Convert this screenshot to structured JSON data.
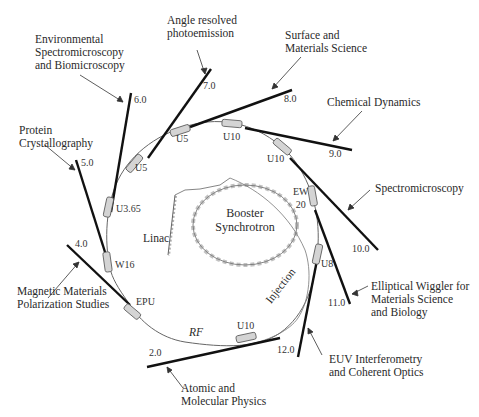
{
  "diagram": {
    "center": {
      "booster": "Booster\nSynchrotron",
      "linac": "Linac",
      "rf": "RF",
      "injection": "Injection"
    },
    "beamlines": [
      {
        "id": "2.0",
        "number": "2.0",
        "application": "Atomic and\nMolecular Physics"
      },
      {
        "id": "4.0",
        "number": "4.0",
        "application": "Magnetic Materials\nPolarization Studies"
      },
      {
        "id": "5.0",
        "number": "5.0",
        "application": "Protein\nCrystallography"
      },
      {
        "id": "6.0",
        "number": "6.0",
        "application": "Environmental\nSpectromicroscopy\nand Biomicroscopy"
      },
      {
        "id": "7.0",
        "number": "7.0",
        "application": "Angle resolved\nphotoemission"
      },
      {
        "id": "8.0",
        "number": "8.0",
        "application": "Surface and\nMaterials Science"
      },
      {
        "id": "9.0",
        "number": "9.0",
        "application": "Chemical Dynamics"
      },
      {
        "id": "10.0",
        "number": "10.0",
        "application": "Spectromicroscopy"
      },
      {
        "id": "11.0",
        "number": "11.0",
        "application": "Elliptical Wiggler for\nMaterials Science\nand Biology"
      },
      {
        "id": "12.0",
        "number": "12.0",
        "application": "EUV Interferometry\nand Coherent Optics"
      }
    ],
    "insertion_devices": [
      {
        "label": "U3.65"
      },
      {
        "label": "U5"
      },
      {
        "label": "U5"
      },
      {
        "label": "U10"
      },
      {
        "label": "U10"
      },
      {
        "label": "EW\n20"
      },
      {
        "label": "U8"
      },
      {
        "label": "U10"
      },
      {
        "label": "EPU"
      },
      {
        "label": "W16"
      }
    ],
    "colors": {
      "line": "#111111",
      "ring": "#555555",
      "device_fill": "#d4d4d4",
      "text": "#2a2a2a"
    }
  }
}
